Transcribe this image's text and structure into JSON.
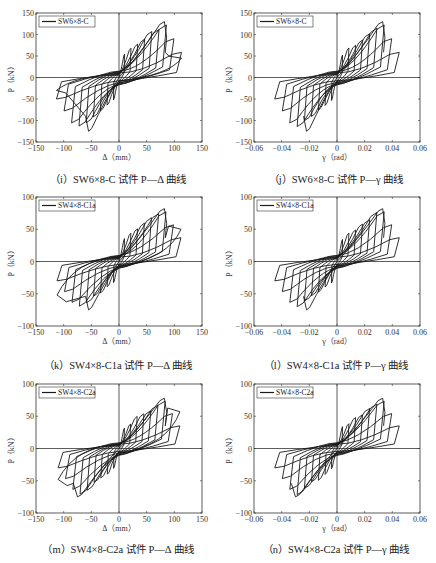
{
  "chart_data": [
    {
      "id": "i",
      "type": "line",
      "caption": "（i）SW6×8-C 试件 P—Δ 曲线",
      "title": "",
      "legend": [
        "SW6×8-C"
      ],
      "legend_position": "upper left",
      "xlabel": "Δ（mm）",
      "ylabel": "P（kN）",
      "xlim": [
        -150,
        150
      ],
      "ylim": [
        -150,
        150
      ],
      "xticks": [
        -150,
        -100,
        -50,
        0,
        50,
        100,
        150
      ],
      "yticks": [
        -150,
        -100,
        -50,
        0,
        50,
        100,
        150
      ],
      "grid": false,
      "series": [
        {
          "name": "SW6×8-C",
          "peak_positive": [
            82,
            130
          ],
          "peak_negative": [
            -55,
            -125
          ],
          "max_x": 113,
          "min_x": -113,
          "end_positive": [
            113,
            45
          ],
          "end_negative": [
            -113,
            -30
          ]
        }
      ]
    },
    {
      "id": "j",
      "type": "line",
      "caption": "（j）SW6×8-C 试件 P—γ 曲线",
      "legend": [
        "SW6×8-C"
      ],
      "legend_position": "upper left",
      "xlabel": "γ（rad）",
      "ylabel": "P（kN）",
      "xlim": [
        -0.06,
        0.06
      ],
      "ylim": [
        -150,
        150
      ],
      "xticks": [
        -0.06,
        -0.04,
        -0.02,
        0,
        0.02,
        0.04,
        0.06
      ],
      "yticks": [
        -150,
        -100,
        -50,
        0,
        50,
        100,
        150
      ],
      "grid": false,
      "series": [
        {
          "name": "SW6×8-C",
          "peak_positive": [
            0.033,
            130
          ],
          "peak_negative": [
            -0.022,
            -125
          ],
          "max_x": 0.045,
          "min_x": -0.045
        }
      ]
    },
    {
      "id": "k",
      "type": "line",
      "caption": "（k）SW4×8-C1a 试件 P—Δ 曲线",
      "legend": [
        "SW4×8-C1a"
      ],
      "legend_position": "upper left",
      "xlabel": "Δ（mm）",
      "ylabel": "P（kN）",
      "xlim": [
        -150,
        150
      ],
      "ylim": [
        -100,
        100
      ],
      "xticks": [
        -150,
        -100,
        -50,
        0,
        50,
        100,
        150
      ],
      "yticks": [
        -100,
        -50,
        0,
        50,
        100
      ],
      "grid": false,
      "series": [
        {
          "name": "SW4×8-C1a",
          "peak_positive": [
            82,
            82
          ],
          "peak_negative": [
            -55,
            -75
          ],
          "max_x": 112,
          "min_x": -112,
          "end_positive": [
            112,
            50
          ],
          "end_negative": [
            -112,
            -52
          ]
        }
      ]
    },
    {
      "id": "l",
      "type": "line",
      "caption": "（l）SW4×8-C1a 试件 P—γ 曲线",
      "legend": [
        "SW4×8-C1a"
      ],
      "legend_position": "upper left",
      "xlabel": "γ（rad）",
      "ylabel": "P（kN）",
      "xlim": [
        -0.06,
        0.06
      ],
      "ylim": [
        -100,
        100
      ],
      "xticks": [
        -0.06,
        -0.04,
        -0.02,
        0,
        0.02,
        0.04,
        0.06
      ],
      "yticks": [
        -100,
        -50,
        0,
        50,
        100
      ],
      "grid": false,
      "series": [
        {
          "name": "SW4×8-C1a",
          "peak_positive": [
            0.033,
            82
          ],
          "peak_negative": [
            -0.022,
            -75
          ],
          "max_x": 0.045,
          "min_x": -0.045
        }
      ]
    },
    {
      "id": "m",
      "type": "line",
      "caption": "（m）SW4×8-C2a 试件 P—Δ 曲线",
      "legend": [
        "SW4×8-C2a"
      ],
      "legend_position": "upper left",
      "xlabel": "Δ（mm）",
      "ylabel": "P（kN）",
      "xlim": [
        -150,
        150
      ],
      "ylim": [
        -100,
        100
      ],
      "xticks": [
        -150,
        -100,
        -50,
        0,
        50,
        100,
        150
      ],
      "yticks": [
        -100,
        -50,
        0,
        50,
        100
      ],
      "grid": false,
      "series": [
        {
          "name": "SW4×8-C2a",
          "peak_positive": [
            82,
            78
          ],
          "peak_negative": [
            -75,
            -75
          ],
          "max_x": 110,
          "min_x": -110,
          "end_positive": [
            110,
            57
          ],
          "end_negative": [
            -110,
            -48
          ]
        }
      ]
    },
    {
      "id": "n",
      "type": "line",
      "caption": "（n）SW4×8-C2a 试件 P—γ 曲线",
      "legend": [
        "SW4×8-C2a"
      ],
      "legend_position": "upper left",
      "xlabel": "γ（rad）",
      "ylabel": "P（kN）",
      "xlim": [
        -0.06,
        0.06
      ],
      "ylim": [
        -100,
        100
      ],
      "xticks": [
        -0.06,
        -0.04,
        -0.02,
        0,
        0.02,
        0.04,
        0.06
      ],
      "yticks": [
        -100,
        -50,
        0,
        50,
        100
      ],
      "grid": false,
      "series": [
        {
          "name": "SW4×8-C2a",
          "peak_positive": [
            0.033,
            78
          ],
          "peak_negative": [
            -0.03,
            -75
          ],
          "max_x": 0.045,
          "min_x": -0.045
        }
      ]
    }
  ],
  "panels": [
    {
      "caption": "（i）SW6×8-C 试件 P—Δ 曲线",
      "legend": "SW6×8-C",
      "xlabel": "Δ（mm）",
      "ylabel": "P（kN）",
      "xticks": [
        "−150",
        "−100",
        "−50",
        "0",
        "50",
        "100",
        "150"
      ],
      "yticks": [
        "150",
        "100",
        "50",
        "0",
        "−50",
        "−100",
        "−150"
      ]
    },
    {
      "caption": "（j）SW6×8-C 试件 P—γ 曲线",
      "legend": "SW6×8-C",
      "xlabel": "γ（rad）",
      "ylabel": "P（kN）",
      "xticks": [
        "−0.06",
        "−0.04",
        "−0.02",
        "0",
        "0.02",
        "0.04",
        "0.06"
      ],
      "yticks": [
        "150",
        "100",
        "50",
        "0",
        "−50",
        "−100",
        "−150"
      ]
    },
    {
      "caption": "（k）SW4×8-C1a 试件 P—Δ 曲线",
      "legend": "SW4×8-C1a",
      "xlabel": "Δ（mm）",
      "ylabel": "P（kN）",
      "xticks": [
        "−150",
        "−100",
        "−50",
        "0",
        "50",
        "100",
        "150"
      ],
      "yticks": [
        "100",
        "50",
        "0",
        "−50",
        "−100"
      ]
    },
    {
      "caption": "（l）SW4×8-C1a 试件 P—γ 曲线",
      "legend": "SW4×8-C1a",
      "xlabel": "γ（rad）",
      "ylabel": "P（kN）",
      "xticks": [
        "−0.06",
        "−0.04",
        "−0.02",
        "0",
        "0.02",
        "0.04",
        "0.06"
      ],
      "yticks": [
        "100",
        "50",
        "0",
        "−50",
        "−100"
      ]
    },
    {
      "caption": "（m）SW4×8-C2a 试件 P—Δ 曲线",
      "legend": "SW4×8-C2a",
      "xlabel": "Δ（mm）",
      "ylabel": "P（kN）",
      "xticks": [
        "−150",
        "−100",
        "−50",
        "0",
        "50",
        "100",
        "150"
      ],
      "yticks": [
        "100",
        "50",
        "0",
        "−50",
        "−100"
      ]
    },
    {
      "caption": "（n）SW4×8-C2a 试件 P—γ 曲线",
      "legend": "SW4×8-C2a",
      "xlabel": "γ（rad）",
      "ylabel": "P（kN）",
      "xticks": [
        "−0.06",
        "−0.04",
        "−0.02",
        "0",
        "0.02",
        "0.04",
        "0.06"
      ],
      "yticks": [
        "100",
        "50",
        "0",
        "−50",
        "−100"
      ]
    }
  ],
  "colors": {
    "line": "#1a1a1a",
    "axis": "#333333",
    "background": "#ffffff"
  }
}
